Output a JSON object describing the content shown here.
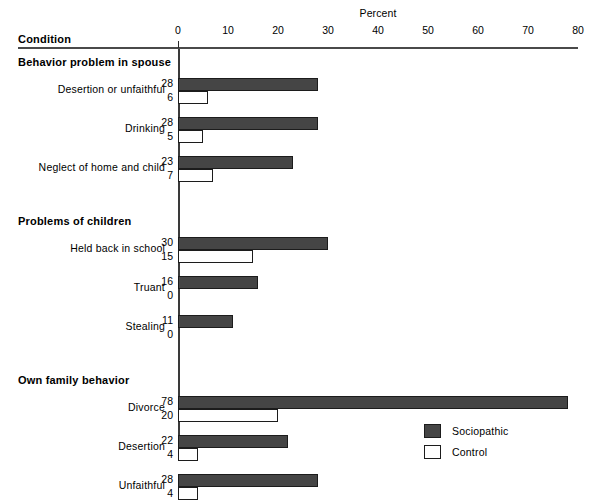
{
  "chart_data": {
    "type": "bar",
    "orientation": "horizontal",
    "title": "",
    "xlabel": "Percent",
    "ylabel": "Condition",
    "xlim": [
      0,
      80
    ],
    "xticks": [
      0,
      10,
      20,
      30,
      40,
      50,
      60,
      70,
      80
    ],
    "grid": false,
    "legend_position": "bottom-right",
    "series": [
      {
        "name": "Sociopathic",
        "color": "#454545"
      },
      {
        "name": "Control",
        "color": "#ffffff"
      }
    ],
    "groups": [
      {
        "label": "Behavior problem in spouse",
        "rows": [
          {
            "label": "Desertion or unfaithful",
            "sociopathic": 28,
            "control": 6
          },
          {
            "label": "Drinking",
            "sociopathic": 28,
            "control": 5
          },
          {
            "label": "Neglect of home and child",
            "sociopathic": 23,
            "control": 7
          }
        ]
      },
      {
        "label": "Problems of children",
        "rows": [
          {
            "label": "Held back in school",
            "sociopathic": 30,
            "control": 15
          },
          {
            "label": "Truant",
            "sociopathic": 16,
            "control": 0
          },
          {
            "label": "Stealing",
            "sociopathic": 11,
            "control": 0
          }
        ]
      },
      {
        "label": "Own family behavior",
        "rows": [
          {
            "label": "Divorce",
            "sociopathic": 78,
            "control": 20
          },
          {
            "label": "Desertion",
            "sociopathic": 22,
            "control": 4
          },
          {
            "label": "Unfaithful",
            "sociopathic": 28,
            "control": 4
          }
        ]
      }
    ]
  },
  "header": {
    "condition_label": "Condition",
    "percent_label": "Percent"
  },
  "axis": {
    "ticks": [
      "0",
      "10",
      "20",
      "30",
      "40",
      "50",
      "60",
      "70",
      "80"
    ]
  },
  "groups": {
    "g0": "Behavior problem in spouse",
    "g1": "Problems of children",
    "g2": "Own family behavior"
  },
  "rows": {
    "r0": {
      "label": "Desertion or unfaithful",
      "soc": "28",
      "ctl": "6"
    },
    "r1": {
      "label": "Drinking",
      "soc": "28",
      "ctl": "5"
    },
    "r2": {
      "label": "Neglect of home and child",
      "soc": "23",
      "ctl": "7"
    },
    "r3": {
      "label": "Held back in school",
      "soc": "30",
      "ctl": "15"
    },
    "r4": {
      "label": "Truant",
      "soc": "16",
      "ctl": "0"
    },
    "r5": {
      "label": "Stealing",
      "soc": "11",
      "ctl": "0"
    },
    "r6": {
      "label": "Divorce",
      "soc": "78",
      "ctl": "20"
    },
    "r7": {
      "label": "Desertion",
      "soc": "22",
      "ctl": "4"
    },
    "r8": {
      "label": "Unfaithful",
      "soc": "28",
      "ctl": "4"
    }
  },
  "legend": {
    "sociopathic": "Sociopathic",
    "control": "Control"
  },
  "colors": {
    "sociopathic_fill": "#454545",
    "control_fill": "#ffffff",
    "bar_stroke": "#1c1c1c",
    "rule": "#4a4a4a"
  }
}
